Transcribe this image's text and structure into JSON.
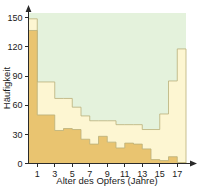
{
  "chart_data": {
    "type": "bar",
    "title": "",
    "subtitle": "",
    "xlabel": "Alter des Opfers (Jahre)",
    "ylabel": "Häufigkeit",
    "grid": false,
    "legend_position": "none",
    "xlim": [
      0,
      18
    ],
    "ylim": [
      0,
      155
    ],
    "x_tick_labels": [
      "1",
      "3",
      "5",
      "7",
      "9",
      "11",
      "13",
      "15",
      "17"
    ],
    "x_tick_values": [
      1,
      3,
      5,
      7,
      9,
      11,
      13,
      15,
      17
    ],
    "y_tick_labels": [
      "0",
      "30",
      "60",
      "90",
      "120",
      "150"
    ],
    "y_tick_values": [
      0,
      30,
      60,
      90,
      120,
      150
    ],
    "categories": [
      "0",
      "1",
      "2",
      "3",
      "4",
      "5",
      "6",
      "7",
      "8",
      "9",
      "10",
      "11",
      "12",
      "13",
      "14",
      "15",
      "16",
      "17"
    ],
    "series": [
      {
        "name": "Gesamt",
        "color": "#fdf6d2",
        "values": [
          149,
          84,
          84,
          67,
          67,
          58,
          49,
          44,
          44,
          44,
          40,
          40,
          40,
          35,
          35,
          51,
          85,
          118
        ]
      },
      {
        "name": "Teilgruppe",
        "color": "#e9c470",
        "values": [
          137,
          50,
          50,
          34,
          36,
          35,
          25,
          20,
          28,
          22,
          16,
          21,
          20,
          15,
          4,
          3,
          7,
          1
        ]
      }
    ],
    "colors": {
      "plot_background": "#e4f2dc",
      "outer_series_fill": "#fdf6d2",
      "inner_series_fill": "#e9c470",
      "outline": "#b9b07a",
      "axis": "#2a2a2a",
      "text": "#1a1a1a",
      "page_background": "#ffffff"
    }
  },
  "axes": {
    "x_title": "Alter des Opfers (Jahre)",
    "y_title": "Häufigkeit"
  },
  "y_labels": {
    "t0": "0",
    "t30": "30",
    "t60": "60",
    "t90": "90",
    "t120": "120",
    "t150": "150"
  },
  "x_labels": {
    "t1": "1",
    "t3": "3",
    "t5": "5",
    "t7": "7",
    "t9": "9",
    "t11": "11",
    "t13": "13",
    "t15": "15",
    "t17": "17"
  }
}
